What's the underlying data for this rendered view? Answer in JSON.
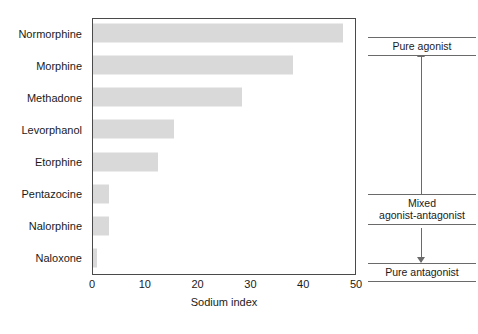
{
  "chart_data": {
    "type": "bar",
    "orientation": "horizontal",
    "title": "",
    "subtitle": "",
    "xlabel": "Sodium index",
    "ylabel": "",
    "xlim": [
      0,
      50
    ],
    "ylim": null,
    "xticks": [
      0,
      10,
      20,
      30,
      40,
      50
    ],
    "xtick_labels": [
      "0",
      "10",
      "20",
      "30",
      "40",
      "50"
    ],
    "grid": false,
    "legend": null,
    "legend_position": "none",
    "bar_color": "#d9d9d9",
    "frame_color": "#4a4a4a",
    "categories": [
      "Normorphine",
      "Morphine",
      "Methadone",
      "Levorphanol",
      "Etorphine",
      "Pentazocine",
      "Nalorphine",
      "Naloxone"
    ],
    "values": [
      47.3,
      37.8,
      28.3,
      15.4,
      12.4,
      3.1,
      3.0,
      0.8
    ],
    "annotations": [
      {
        "id": "pure-agonist",
        "lines": [
          "Pure agonist"
        ],
        "text": "Pure agonist"
      },
      {
        "id": "mixed-agonist-antagonist",
        "lines": [
          "Mixed",
          "agonist-antagonist"
        ],
        "text": "Mixed agonist-antagonist"
      },
      {
        "id": "pure-antagonist",
        "lines": [
          "Pure antagonist"
        ],
        "text": "Pure antagonist"
      }
    ]
  },
  "axis": {
    "x_title": "Sodium index",
    "tick_0": "0",
    "tick_1": "10",
    "tick_2": "20",
    "tick_3": "30",
    "tick_4": "40",
    "tick_5": "50"
  },
  "categories": {
    "c0": "Normorphine",
    "c1": "Morphine",
    "c2": "Methadone",
    "c3": "Levorphanol",
    "c4": "Etorphine",
    "c5": "Pentazocine",
    "c6": "Nalorphine",
    "c7": "Naloxone"
  },
  "annotations": {
    "pure_agonist": "Pure agonist",
    "mixed_line1": "Mixed",
    "mixed_line2": "agonist-antagonist",
    "pure_antagonist": "Pure antagonist"
  }
}
